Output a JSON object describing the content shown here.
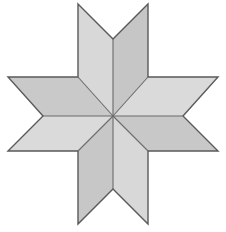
{
  "figure": {
    "shape_name": "greek-cross-pinwheel",
    "background_color": "#ffffff",
    "canvas": {
      "width": 226,
      "height": 232
    },
    "outline_color": "#5a5a5a",
    "outline_width": 1.4,
    "crease_color": "#6b6b6b",
    "crease_width": 1.1,
    "palette": {
      "light": "#dcdcdc",
      "light_alt": "#d6d6d6",
      "mid": "#cfcfcf",
      "dark": "#bfbfbf",
      "dark_alt": "#b9b9b9"
    },
    "geometry": {
      "center": {
        "x": 113,
        "y": 116
      },
      "bounds": {
        "left": 8,
        "right": 218,
        "top": 4,
        "bottom": 224
      },
      "band_x": {
        "left": 78,
        "right": 148
      },
      "band_y": {
        "top": 77,
        "bottom": 151
      },
      "chevron_inset": 28
    },
    "faces": [
      {
        "name": "top-arm-left-face",
        "points": "78,4 113,39 113,116 78,77",
        "fill": "#d8d8d8"
      },
      {
        "name": "top-arm-right-face",
        "points": "148,4 113,39 113,116 148,77",
        "fill": "#c6c6c6"
      },
      {
        "name": "top-chevron-notch",
        "points": "78,4 148,4 113,39",
        "fill": "#ffffff"
      },
      {
        "name": "right-arm-top-face",
        "points": "218,77 183,116 113,116 148,77",
        "fill": "#dadada"
      },
      {
        "name": "right-arm-bottom-face",
        "points": "218,151 183,116 113,116 148,151",
        "fill": "#c8c8c8"
      },
      {
        "name": "right-chevron-notch",
        "points": "218,77 218,151 183,116",
        "fill": "#ffffff"
      },
      {
        "name": "bottom-arm-right-face",
        "points": "148,224 113,189 113,116 148,151",
        "fill": "#d8d8d8"
      },
      {
        "name": "bottom-arm-left-face",
        "points": "78,224 113,189 113,116 78,151",
        "fill": "#c7c7c7"
      },
      {
        "name": "bottom-chevron-notch",
        "points": "78,224 148,224 113,189",
        "fill": "#ffffff"
      },
      {
        "name": "left-arm-bottom-face",
        "points": "8,151 43,116 113,116 78,151",
        "fill": "#dadada"
      },
      {
        "name": "left-arm-top-face",
        "points": "8,77 43,116 113,116 78,77",
        "fill": "#c9c9c9"
      },
      {
        "name": "left-chevron-notch",
        "points": "8,77 8,151 43,116",
        "fill": "#ffffff"
      }
    ],
    "outline_path": "M 78,4 L 113,39 L 148,4 L 148,77 L 218,77 L 183,116 L 218,151 L 148,151 L 148,224 L 113,189 L 78,224 L 78,151 L 8,151 L 43,116 L 8,77 L 78,77 Z",
    "creases": [
      {
        "name": "crease-center-to-top",
        "x1": 113,
        "y1": 39,
        "x2": 113,
        "y2": 116
      },
      {
        "name": "crease-center-to-bottom",
        "x1": 113,
        "y1": 189,
        "x2": 113,
        "y2": 116
      },
      {
        "name": "crease-center-to-left",
        "x1": 43,
        "y1": 116,
        "x2": 113,
        "y2": 116
      },
      {
        "name": "crease-center-to-right",
        "x1": 183,
        "y1": 116,
        "x2": 113,
        "y2": 116
      },
      {
        "name": "crease-center-to-corner-tl",
        "x1": 78,
        "y1": 77,
        "x2": 113,
        "y2": 116
      },
      {
        "name": "crease-center-to-corner-tr",
        "x1": 148,
        "y1": 77,
        "x2": 113,
        "y2": 116
      },
      {
        "name": "crease-center-to-corner-bl",
        "x1": 78,
        "y1": 151,
        "x2": 113,
        "y2": 116
      },
      {
        "name": "crease-center-to-corner-br",
        "x1": 148,
        "y1": 151,
        "x2": 113,
        "y2": 116
      }
    ]
  }
}
